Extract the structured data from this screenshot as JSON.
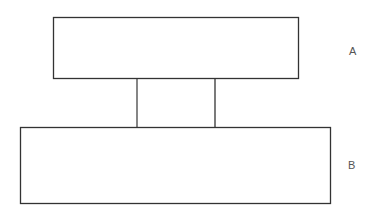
{
  "diagram": {
    "title": "",
    "nodes": [
      {
        "id": "A",
        "label": "A"
      },
      {
        "id": "B",
        "label": "B"
      }
    ],
    "edges": [
      {
        "from": "A",
        "to": "B",
        "type": "two-line connector"
      }
    ],
    "colors": {
      "stroke": "#333333",
      "label": "#555555",
      "background": "#ffffff"
    }
  }
}
